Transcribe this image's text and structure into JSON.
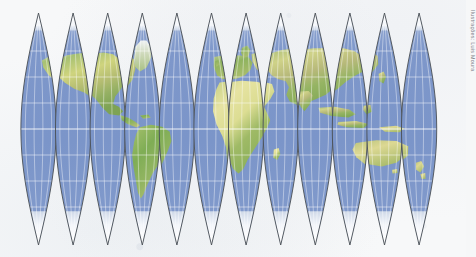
{
  "figure": {
    "kind": "world-map-globe-gores",
    "projection_label": "interrupted globe gores",
    "gore_count": 12,
    "credit": "Ilustrações: Luis Moura",
    "colors": {
      "background": "#f7f8f9",
      "ocean": "#7b95c9",
      "ocean_shallow": "#90a7d3",
      "land_green": "#93b56b",
      "land_dark_green": "#6f9a55",
      "land_tan": "#ddddA0",
      "land_desert": "#e3e0a2",
      "land_highland": "#b8a878",
      "ice": "#fbfcfd",
      "graticule": "#ffffff",
      "gore_outline": "#4a4f55",
      "credit_text": "#7e8189"
    },
    "geometry": {
      "gore_top_y": 13,
      "gore_bottom_y": 245,
      "gore_equator_y": 129,
      "gore_half_width": 17.6,
      "gore_spacing": 34.6,
      "first_gore_center_x": 38.5,
      "graticule_lat_step_px": 26,
      "graticule_lon_step_px": 8.8
    }
  },
  "chart_data": {
    "type": "map",
    "title": "",
    "gore_centers_x": [
      38.5,
      73.1,
      107.7,
      142.3,
      176.9,
      211.5,
      246.1,
      280.7,
      315.3,
      349.9,
      384.5,
      419.1
    ],
    "latitude_lines_y": [
      25,
      51,
      77,
      103,
      129,
      155,
      181,
      207,
      233
    ],
    "equator_y": 129,
    "landmasses": [
      {
        "name": "Greenland",
        "gores": [
          1,
          2
        ],
        "tone": "ice-green"
      },
      {
        "name": "North America",
        "gores": [
          2,
          3,
          4
        ],
        "tone": "green-tan"
      },
      {
        "name": "Central America",
        "gores": [
          4
        ],
        "tone": "green"
      },
      {
        "name": "South America",
        "gores": [
          4,
          5
        ],
        "tone": "green-tan"
      },
      {
        "name": "Europe",
        "gores": [
          7,
          8
        ],
        "tone": "green"
      },
      {
        "name": "Africa",
        "gores": [
          7,
          8
        ],
        "tone": "tan-green"
      },
      {
        "name": "Asia",
        "gores": [
          8,
          9,
          10
        ],
        "tone": "tan-green"
      },
      {
        "name": "Australia",
        "gores": [
          10,
          11
        ],
        "tone": "tan"
      },
      {
        "name": "Antarctica",
        "gores": [
          1,
          2,
          3,
          4,
          5,
          6,
          7,
          8,
          9,
          10,
          11,
          12
        ],
        "tone": "ice"
      }
    ]
  }
}
